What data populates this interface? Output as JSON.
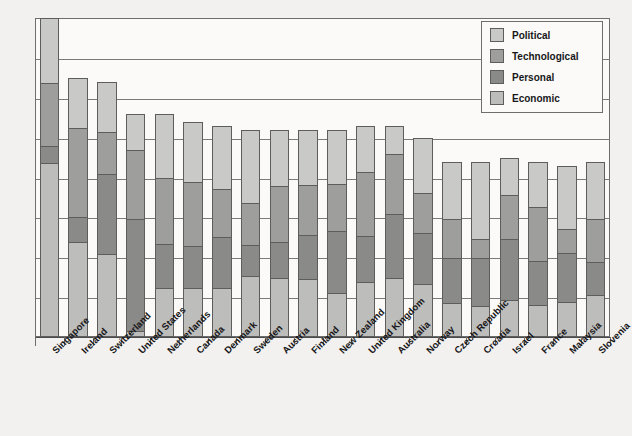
{
  "chart_data": {
    "type": "bar",
    "subtype": "stacked-bar",
    "title": "",
    "xlabel": "",
    "ylabel": "",
    "grid": true,
    "ylim": [
      0,
      8
    ],
    "gridline_count": 8,
    "legend_position": "top-right",
    "categories": [
      "Singapore",
      "Ireland",
      "Switzerland",
      "United States",
      "Netherlands",
      "Canada",
      "Denmark",
      "Sweden",
      "Austria",
      "Finland",
      "New Zealand",
      "United Kingdom",
      "Australia",
      "Norway",
      "Czech Republic",
      "Croatia",
      "Israel",
      "France",
      "Malaysia",
      "Slovenia"
    ],
    "series": [
      {
        "name": "Political",
        "color": "#c9c9c7",
        "values": [
          1.62,
          1.27,
          1.25,
          0.9,
          1.62,
          1.5,
          1.58,
          1.83,
          1.4,
          1.4,
          1.35,
          1.15,
          0.72,
          1.4,
          1.45,
          1.95,
          0.95,
          1.15,
          1.6,
          1.45
        ]
      },
      {
        "name": "Technological",
        "color": "#9e9e9c",
        "values": [
          1.6,
          2.22,
          1.05,
          1.75,
          1.65,
          1.62,
          1.2,
          1.05,
          1.42,
          1.25,
          1.2,
          1.62,
          1.5,
          0.98,
          0.97,
          0.48,
          1.08,
          1.35,
          0.6,
          1.08
        ]
      },
      {
        "name": "Personal",
        "color": "#8a8a88",
        "values": [
          0.42,
          0.62,
          2.02,
          2.8,
          1.1,
          1.05,
          1.3,
          0.8,
          0.9,
          1.1,
          1.55,
          1.15,
          1.6,
          1.3,
          1.12,
          1.18,
          1.53,
          1.1,
          1.22,
          0.82
        ]
      },
      {
        "name": "Economic",
        "color": "#bdbdbb",
        "values": [
          4.36,
          2.39,
          2.08,
          0.15,
          1.23,
          1.23,
          1.22,
          1.52,
          1.48,
          1.45,
          1.1,
          1.38,
          1.48,
          1.32,
          0.86,
          0.79,
          0.94,
          0.8,
          0.88,
          1.05
        ]
      }
    ],
    "totals": [
      8.0,
      6.5,
      6.4,
      5.6,
      5.6,
      5.4,
      5.3,
      5.2,
      5.2,
      5.2,
      5.2,
      5.3,
      5.3,
      5.0,
      4.4,
      4.4,
      4.5,
      4.4,
      4.3,
      4.4
    ]
  },
  "legend": {
    "items": [
      {
        "label": "Political",
        "color": "#c9c9c7"
      },
      {
        "label": "Technological",
        "color": "#9e9e9c"
      },
      {
        "label": "Personal",
        "color": "#8a8a88"
      },
      {
        "label": "Economic",
        "color": "#bdbdbb"
      }
    ]
  },
  "style": {
    "page_background": "#f2f1ef",
    "plot_background": "#fbfaf8",
    "frame_color": "#6e6e6e",
    "grid_color": "#7a7a7a",
    "segment_border": "#5d5d5d",
    "text_color": "#17171a"
  }
}
